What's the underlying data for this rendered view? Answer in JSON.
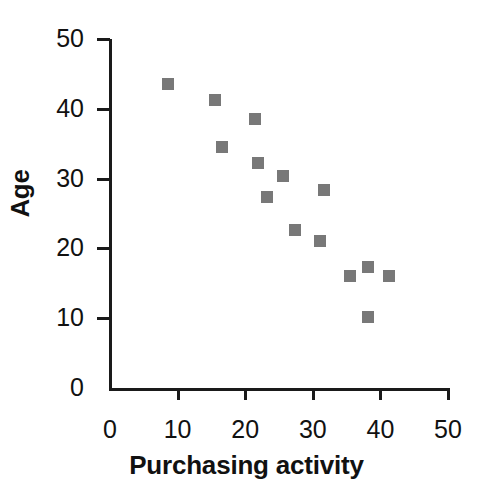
{
  "chart_data": {
    "type": "scatter",
    "title": "",
    "xlabel": "Purchasing activity",
    "ylabel": "Age",
    "xlim": [
      0,
      50
    ],
    "ylim": [
      0,
      50
    ],
    "xticks": [
      "0",
      "10",
      "20",
      "30",
      "40",
      "50"
    ],
    "yticks": [
      "0",
      "10",
      "20",
      "30",
      "40",
      "50"
    ],
    "xtick_values": [
      0,
      10,
      20,
      30,
      40,
      50
    ],
    "ytick_values": [
      0,
      10,
      20,
      30,
      40,
      50
    ],
    "grid": false,
    "legend": false,
    "marker": "square",
    "marker_color": "#787878",
    "marker_size_px": 12,
    "series": [
      {
        "name": "respondents",
        "points": [
          {
            "x": 8.6,
            "y": 43.5
          },
          {
            "x": 15.5,
            "y": 41.3
          },
          {
            "x": 21.5,
            "y": 38.6
          },
          {
            "x": 16.6,
            "y": 34.5
          },
          {
            "x": 21.9,
            "y": 32.2
          },
          {
            "x": 25.6,
            "y": 30.4
          },
          {
            "x": 23.2,
            "y": 27.4
          },
          {
            "x": 31.7,
            "y": 28.4
          },
          {
            "x": 27.4,
            "y": 22.6
          },
          {
            "x": 31.0,
            "y": 21.0
          },
          {
            "x": 35.5,
            "y": 16.0
          },
          {
            "x": 38.2,
            "y": 17.3
          },
          {
            "x": 41.2,
            "y": 16.1
          },
          {
            "x": 38.1,
            "y": 10.2
          }
        ]
      }
    ]
  },
  "axis": {
    "y_title": "Age",
    "x_title": "Purchasing activity"
  }
}
